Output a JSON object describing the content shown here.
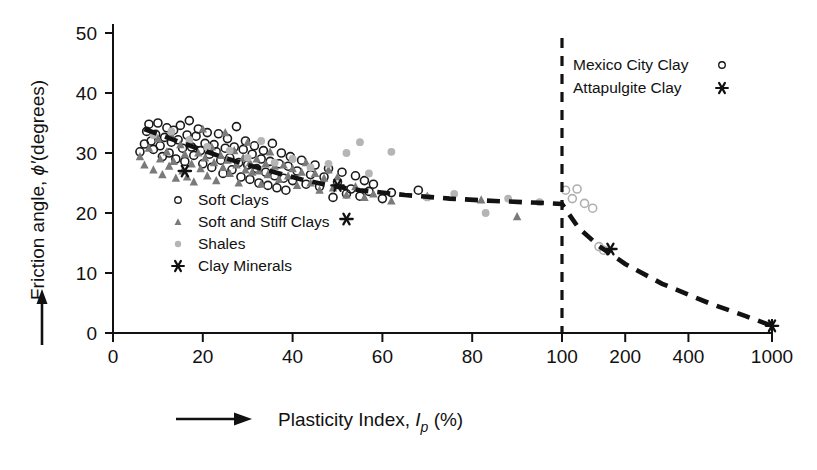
{
  "chart_data": {
    "type": "scatter",
    "title": "",
    "xlabel": "Plasticity Index, Ip (%)",
    "ylabel": "Friction angle, ϕ'(degrees)",
    "xlabel_parts": {
      "main": "Plasticity Index, ",
      "sym": "I",
      "sub": "p",
      "unit": " (%)"
    },
    "ylabel_parts": {
      "main": "Friction angle, ",
      "sym": "ϕ′",
      "unit": "(degrees)"
    },
    "x_scale": "linear 0-100 then compressed log 100-1000",
    "xticks": [
      0,
      20,
      40,
      60,
      80,
      100,
      200,
      400,
      1000
    ],
    "xtick_labels": [
      "0",
      "20",
      "40",
      "60",
      "80",
      "100",
      "200",
      "400",
      "1000"
    ],
    "yticks": [
      0,
      10,
      20,
      30,
      40,
      50
    ],
    "ytick_labels": [
      "0",
      "10",
      "20",
      "30",
      "40",
      "50"
    ],
    "xlim": [
      0,
      1000
    ],
    "ylim": [
      0,
      50
    ],
    "grid": false,
    "annotations": [
      {
        "name": "vertical-divider",
        "x": 100,
        "note": "dashed vertical line at PI = 100"
      }
    ],
    "legend_position": "lower-left inside axes",
    "legend2_position": "upper-right inside axes",
    "series": [
      {
        "name": "Soft Clays",
        "marker": "open-circle",
        "color": "#1a1a1a",
        "points": [
          [
            6,
            30.2
          ],
          [
            7,
            31.5
          ],
          [
            7.5,
            33.6
          ],
          [
            8,
            34.8
          ],
          [
            8.5,
            32.0
          ],
          [
            9,
            30.6
          ],
          [
            9.5,
            33.1
          ],
          [
            10,
            35.0
          ],
          [
            10.5,
            31.2
          ],
          [
            11,
            29.4
          ],
          [
            11.5,
            32.6
          ],
          [
            12,
            34.2
          ],
          [
            12.5,
            30.0
          ],
          [
            13,
            31.8
          ],
          [
            13.5,
            33.8
          ],
          [
            14,
            29.0
          ],
          [
            14.5,
            32.2
          ],
          [
            15,
            34.6
          ],
          [
            15.5,
            30.8
          ],
          [
            16,
            28.6
          ],
          [
            16.5,
            33.0
          ],
          [
            17,
            35.4
          ],
          [
            17.5,
            31.0
          ],
          [
            18,
            29.6
          ],
          [
            18.5,
            32.8
          ],
          [
            19,
            34.0
          ],
          [
            19.5,
            30.4
          ],
          [
            20,
            28.2
          ],
          [
            20.5,
            31.6
          ],
          [
            21,
            33.4
          ],
          [
            21.5,
            29.8
          ],
          [
            22,
            27.6
          ],
          [
            22.5,
            31.4
          ],
          [
            23,
            30.2
          ],
          [
            23.5,
            33.2
          ],
          [
            24,
            28.8
          ],
          [
            24.5,
            26.6
          ],
          [
            25,
            30.8
          ],
          [
            25.5,
            32.4
          ],
          [
            26,
            29.2
          ],
          [
            26.5,
            27.2
          ],
          [
            27,
            31.0
          ],
          [
            27.5,
            34.4
          ],
          [
            28,
            28.4
          ],
          [
            28.5,
            26.0
          ],
          [
            29,
            30.6
          ],
          [
            29.5,
            32.0
          ],
          [
            30,
            28.0
          ],
          [
            30.5,
            25.6
          ],
          [
            31,
            29.8
          ],
          [
            31.5,
            31.2
          ],
          [
            32,
            27.4
          ],
          [
            32.5,
            25.0
          ],
          [
            33,
            29.0
          ],
          [
            33.5,
            30.4
          ],
          [
            34,
            26.8
          ],
          [
            34.5,
            24.6
          ],
          [
            35,
            28.6
          ],
          [
            35.5,
            31.6
          ],
          [
            36,
            26.2
          ],
          [
            36.5,
            24.2
          ],
          [
            37,
            28.2
          ],
          [
            37.5,
            30.0
          ],
          [
            38,
            25.8
          ],
          [
            38.5,
            23.8
          ],
          [
            39,
            27.8
          ],
          [
            39.5,
            29.4
          ],
          [
            40,
            25.4
          ],
          [
            41,
            27.0
          ],
          [
            42,
            28.8
          ],
          [
            43,
            24.8
          ],
          [
            44,
            26.4
          ],
          [
            45,
            28.0
          ],
          [
            46,
            24.4
          ],
          [
            47,
            26.0
          ],
          [
            48,
            27.4
          ],
          [
            49,
            22.6
          ],
          [
            50,
            25.2
          ],
          [
            51,
            26.8
          ],
          [
            52,
            23.2
          ],
          [
            53,
            24.0
          ],
          [
            54,
            26.2
          ],
          [
            55,
            22.8
          ],
          [
            56,
            25.4
          ],
          [
            57,
            23.6
          ],
          [
            58,
            24.8
          ],
          [
            60,
            22.4
          ],
          [
            62,
            23.4
          ],
          [
            68,
            23.8
          ]
        ]
      },
      {
        "name": "Soft and Stiff Clays",
        "marker": "filled-triangle",
        "color": "#7a7a7a",
        "points": [
          [
            6,
            29.4
          ],
          [
            7,
            28.0
          ],
          [
            8,
            30.8
          ],
          [
            9,
            27.2
          ],
          [
            10,
            32.4
          ],
          [
            10.5,
            29.0
          ],
          [
            11,
            26.4
          ],
          [
            12,
            30.2
          ],
          [
            12.5,
            27.8
          ],
          [
            13,
            33.0
          ],
          [
            13.5,
            28.6
          ],
          [
            14,
            25.8
          ],
          [
            15,
            31.4
          ],
          [
            15.5,
            27.0
          ],
          [
            16,
            29.8
          ],
          [
            16.5,
            26.0
          ],
          [
            17,
            32.2
          ],
          [
            17.5,
            28.2
          ],
          [
            18,
            25.2
          ],
          [
            19,
            30.0
          ],
          [
            19.5,
            27.4
          ],
          [
            20,
            34.0
          ],
          [
            20.5,
            29.2
          ],
          [
            21,
            26.2
          ],
          [
            22,
            31.0
          ],
          [
            22.5,
            28.4
          ],
          [
            23,
            25.4
          ],
          [
            24,
            29.6
          ],
          [
            24.5,
            27.6
          ],
          [
            25,
            33.4
          ],
          [
            25.5,
            28.8
          ],
          [
            26,
            26.6
          ],
          [
            27,
            30.4
          ],
          [
            27.5,
            28.0
          ],
          [
            28,
            25.0
          ],
          [
            29,
            29.2
          ],
          [
            29.5,
            27.2
          ],
          [
            30,
            31.8
          ],
          [
            30.5,
            28.4
          ],
          [
            31,
            26.8
          ],
          [
            32,
            29.0
          ],
          [
            32.5,
            27.0
          ],
          [
            33,
            24.8
          ],
          [
            34,
            28.2
          ],
          [
            34.5,
            26.4
          ],
          [
            35,
            30.2
          ],
          [
            36,
            27.8
          ],
          [
            37,
            25.6
          ],
          [
            38,
            28.0
          ],
          [
            39,
            26.2
          ],
          [
            40,
            27.4
          ],
          [
            41,
            24.6
          ],
          [
            42,
            26.8
          ],
          [
            43,
            28.4
          ],
          [
            44,
            25.0
          ],
          [
            45,
            26.6
          ],
          [
            46,
            23.8
          ],
          [
            47,
            25.8
          ],
          [
            48,
            27.2
          ],
          [
            49,
            24.2
          ],
          [
            50,
            26.0
          ],
          [
            52,
            23.0
          ],
          [
            54,
            24.4
          ],
          [
            56,
            22.6
          ],
          [
            58,
            23.2
          ],
          [
            62,
            22.0
          ],
          [
            70,
            22.8
          ],
          [
            82,
            22.2
          ],
          [
            90,
            19.4
          ]
        ]
      },
      {
        "name": "Shales",
        "marker": "filled-circle-gray",
        "color": "#b5b5b5",
        "points": [
          [
            9,
            33.0
          ],
          [
            13,
            33.6
          ],
          [
            17,
            32.2
          ],
          [
            21,
            31.0
          ],
          [
            26,
            30.4
          ],
          [
            30,
            29.2
          ],
          [
            33,
            32.0
          ],
          [
            36,
            28.4
          ],
          [
            40,
            29.0
          ],
          [
            44,
            27.6
          ],
          [
            48,
            28.2
          ],
          [
            52,
            30.0
          ],
          [
            55,
            31.8
          ],
          [
            57,
            26.6
          ],
          [
            62,
            30.2
          ],
          [
            70,
            22.6
          ],
          [
            76,
            23.2
          ],
          [
            83,
            20.0
          ],
          [
            88,
            22.4
          ],
          [
            95,
            21.8
          ]
        ]
      },
      {
        "name": "Clay Minerals",
        "marker": "asterisk",
        "color": "#111111",
        "points": [
          [
            16,
            27.0
          ],
          [
            50,
            24.6
          ],
          [
            52,
            19.0
          ]
        ]
      },
      {
        "name": "Mexico City Clay",
        "marker": "open-circle",
        "color": "#b0b0b0",
        "points": [
          [
            104,
            23.8
          ],
          [
            112,
            22.4
          ],
          [
            118,
            24.0
          ],
          [
            128,
            21.6
          ],
          [
            140,
            20.8
          ],
          [
            150,
            14.4
          ],
          [
            158,
            13.8
          ]
        ]
      },
      {
        "name": "Attapulgite Clay",
        "marker": "asterisk",
        "color": "#111111",
        "points": [
          [
            170,
            14.0
          ],
          [
            1000,
            1.2
          ]
        ]
      }
    ],
    "trend_line": {
      "name": "dashed-trend-line",
      "style": "dashed",
      "points": [
        [
          7,
          34.0
        ],
        [
          12,
          32.6
        ],
        [
          18,
          31.0
        ],
        [
          24,
          29.4
        ],
        [
          30,
          28.0
        ],
        [
          36,
          26.8
        ],
        [
          42,
          25.6
        ],
        [
          48,
          24.6
        ],
        [
          55,
          23.8
        ],
        [
          65,
          23.0
        ],
        [
          75,
          22.4
        ],
        [
          85,
          22.0
        ],
        [
          95,
          21.7
        ],
        [
          100,
          21.5
        ],
        [
          120,
          17.5
        ],
        [
          150,
          14.5
        ],
        [
          200,
          11.5
        ],
        [
          300,
          8.2
        ],
        [
          500,
          5.0
        ],
        [
          750,
          2.8
        ],
        [
          1000,
          1.2
        ]
      ]
    }
  },
  "legend": {
    "items": [
      {
        "label": "Soft Clays",
        "marker": "open-circle"
      },
      {
        "label": "Soft and Stiff Clays",
        "marker": "filled-triangle"
      },
      {
        "label": "Shales",
        "marker": "filled-circle-gray"
      },
      {
        "label": "Clay Minerals",
        "marker": "asterisk"
      }
    ]
  },
  "legend_right": {
    "items": [
      {
        "label": "Mexico City Clay",
        "marker": "open-circle"
      },
      {
        "label": "Attapulgite Clay",
        "marker": "asterisk"
      }
    ]
  },
  "colors": {
    "axis": "#111111",
    "soft_clays": "#1a1a1a",
    "soft_stiff_clays": "#7a7a7a",
    "shales": "#b5b5b5",
    "clay_minerals": "#111111",
    "trend": "#121212",
    "background": "#ffffff"
  }
}
